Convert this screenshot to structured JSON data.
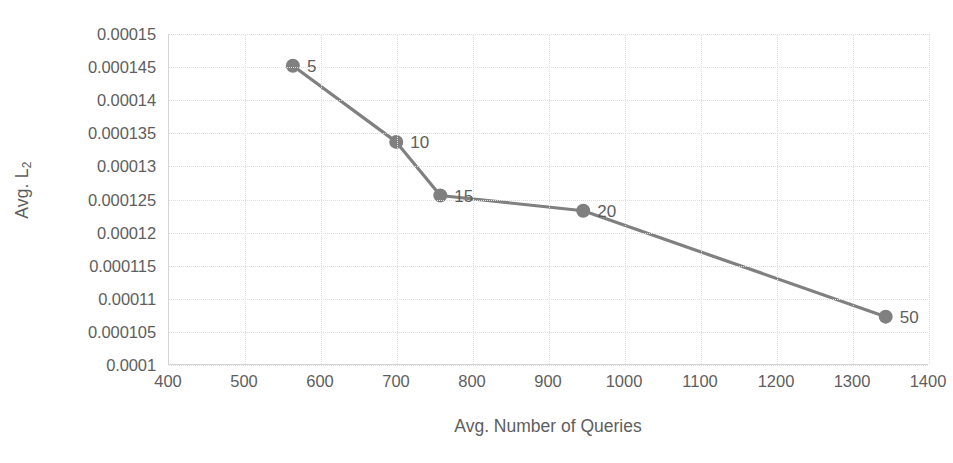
{
  "chart_data": {
    "type": "line",
    "title": "",
    "xlabel": "Avg. Number of Queries",
    "ylabel": "Avg. L2",
    "ylabel_base": "Avg. L",
    "ylabel_sub": "2",
    "xlim": [
      400,
      1400
    ],
    "ylim": [
      0.0001,
      0.00015
    ],
    "grid": true,
    "legend": "none",
    "series_color": "#808080",
    "marker_color": "#808080",
    "x": [
      563,
      699,
      757,
      945,
      1343
    ],
    "y": [
      0.0001452,
      0.0001337,
      0.0001256,
      0.0001233,
      0.0001073
    ],
    "point_labels": [
      "5",
      "10",
      "15",
      "20",
      "50"
    ],
    "xticks": [
      "400",
      "500",
      "600",
      "700",
      "800",
      "900",
      "1000",
      "1100",
      "1200",
      "1300",
      "1400"
    ],
    "xtick_values": [
      400,
      500,
      600,
      700,
      800,
      900,
      1000,
      1100,
      1200,
      1300,
      1400
    ],
    "yticks": [
      "0.00015",
      "0.000145",
      "0.00014",
      "0.000135",
      "0.00013",
      "0.000125",
      "0.00012",
      "0.000115",
      "0.00011",
      "0.000105",
      "0.0001"
    ],
    "ytick_values": [
      0.00015,
      0.000145,
      0.00014,
      0.000135,
      0.00013,
      0.000125,
      0.00012,
      0.000115,
      0.00011,
      0.000105,
      0.0001
    ]
  }
}
